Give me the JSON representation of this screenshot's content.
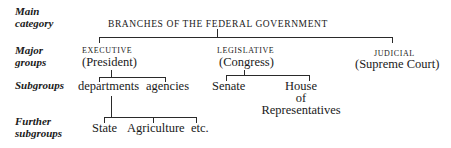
{
  "row_labels": {
    "main": "Main\ncategory",
    "main_1": "Main",
    "main_2": "category",
    "major_1": "Major",
    "major_2": "groups",
    "sub": "Subgroups",
    "further_1": "Further",
    "further_2": "subgroups"
  },
  "root": {
    "label": "BRANCHES OF THE FEDERAL GOVERNMENT"
  },
  "branches": [
    {
      "label": "EXECUTIVE",
      "sub_label": "(President)",
      "children": [
        "departments",
        "agencies"
      ]
    },
    {
      "label": "LEGISLATIVE",
      "sub_label": "(Congress)",
      "children": [
        "Senate",
        "House of Representatives"
      ],
      "house_lines": [
        "House",
        "of",
        "Representatives"
      ]
    },
    {
      "label": "JUDICIAL",
      "sub_label": "(Supreme Court)",
      "children": []
    }
  ],
  "further_subgroups": {
    "parent": "departments",
    "items": [
      "State",
      "Agriculture",
      "etc."
    ]
  }
}
